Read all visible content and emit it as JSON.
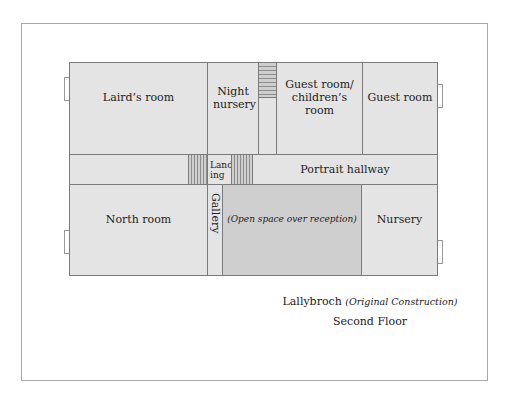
{
  "plan": {
    "rooms": {
      "lairds_room": "Laird’s room",
      "night_nursery": "Night nursery",
      "guest_children": "Guest room/ children’s room",
      "guest_room": "Guest room",
      "landing": "Land- ing",
      "portrait_hallway": "Portrait hallway",
      "north_room": "North room",
      "gallery": "Gallery",
      "open_space": "(Open space over reception)",
      "nursery": "Nursery"
    }
  },
  "caption": {
    "title": "Lallybroch",
    "subtitle": "(Original Construction)",
    "floor": "Second Floor"
  }
}
